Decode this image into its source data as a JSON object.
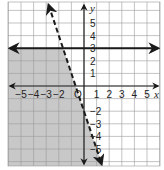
{
  "chart_data": {
    "type": "line",
    "title": "",
    "xlabel": "x",
    "ylabel": "y",
    "xlim": [
      -6,
      6
    ],
    "ylim": [
      -6,
      6.5
    ],
    "grid": true,
    "origin_label": "O",
    "x_ticks": [
      -5,
      -4,
      -3,
      -2,
      1,
      2,
      3,
      4,
      5
    ],
    "y_ticks": [
      5,
      4,
      3,
      2,
      1,
      -2,
      -3,
      -4,
      -5
    ],
    "x_tick_labels": [
      "−5",
      "−4",
      "−3",
      "−2",
      "1",
      "2",
      "3",
      "4",
      "5"
    ],
    "y_tick_labels": [
      "5",
      "4",
      "3",
      "2",
      "1",
      "−2",
      "−3",
      "−4",
      "−5"
    ],
    "series": [
      {
        "name": "y = 3",
        "style": "solid",
        "slope": 0,
        "intercept": 3,
        "arrows": "both"
      },
      {
        "name": "y = -3x - 2",
        "style": "dashed",
        "slope": -3,
        "intercept": -2,
        "arrows": "both"
      }
    ],
    "shaded_region": {
      "description": "y < 3 and y < -3x - 2",
      "color": "#c8c8c8"
    }
  },
  "colors": {
    "grid": "#9a9a9a",
    "axis": "#222222",
    "line": "#1a1a1a",
    "shade": "#c8c8c8"
  }
}
